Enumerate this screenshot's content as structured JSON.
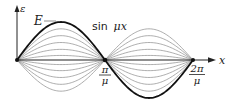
{
  "diagram": {
    "title": "",
    "axis": {
      "y_label": "ε",
      "x_label": "x"
    },
    "curve_label": "E",
    "function_label_prefix": "sin",
    "function_label_var": "μx",
    "ticks": [
      {
        "num": "π",
        "den": "μ"
      },
      {
        "num": "2π",
        "den": "μ"
      }
    ],
    "family": {
      "description": "Family of sinusoidal curves with varying amplitudes sharing nodes at 0, π/μ, 2π/μ",
      "amplitude_fractions": [
        1.0,
        0.82,
        0.64,
        0.46,
        0.28,
        0.12,
        -0.12,
        -0.28,
        -0.46,
        -0.64,
        -0.82
      ],
      "highlighted_amplitude": 1.0
    },
    "colors": {
      "thick_curve": "#111111",
      "thin_curve": "#8a8a8a",
      "axis": "#222222"
    }
  }
}
